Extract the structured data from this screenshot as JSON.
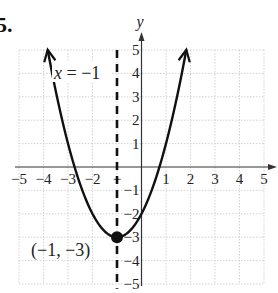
{
  "problem_number": "5.",
  "chart_data": {
    "type": "line",
    "title": "",
    "function": "y = (x + 1)^2 - 3",
    "xlabel": "",
    "ylabel": "y",
    "xlim": [
      -5,
      5
    ],
    "ylim": [
      -5,
      5
    ],
    "grid": true,
    "x_ticks": [
      -5,
      -4,
      -3,
      -2,
      -1,
      1,
      2,
      3,
      4,
      5
    ],
    "y_ticks": [
      5,
      4,
      3,
      2,
      1,
      -1,
      -2,
      -3,
      -4,
      -5
    ],
    "x_tick_labels": [
      "−5",
      "−4",
      "−3",
      "−2",
      "−",
      "1",
      "2",
      "3",
      "4",
      "5"
    ],
    "y_tick_labels": [
      "5",
      "4",
      "3",
      "2",
      "1",
      "−1",
      "−2",
      "−3",
      "−4",
      "−5"
    ],
    "series": [
      {
        "name": "parabola",
        "x": [
          -3.83,
          -3.5,
          -3,
          -2.5,
          -2,
          -1.5,
          -1,
          -0.5,
          0,
          0.5,
          1,
          1.5,
          1.83
        ],
        "values": [
          5,
          3.25,
          1,
          -0.75,
          -2,
          -2.75,
          -3,
          -2.75,
          -2,
          -0.75,
          1,
          3.25,
          5
        ]
      }
    ],
    "vertex": {
      "x": -1,
      "y": -3,
      "label": "(−1, −3)"
    },
    "axis_of_symmetry": {
      "x": -1,
      "label": "x = −1",
      "style": "dashed"
    },
    "x_intercepts": [
      -2.73,
      0.73
    ],
    "y_intercept": -2
  }
}
